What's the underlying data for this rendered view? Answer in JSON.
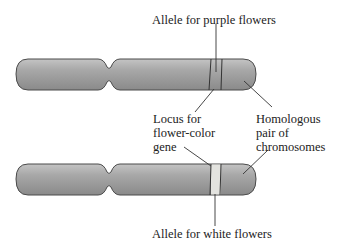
{
  "labels": {
    "allele_purple": "Allele for purple flowers",
    "locus_line1": "Locus for",
    "locus_line2": "flower-color",
    "locus_line3": "gene",
    "homologous_line1": "Homologous",
    "homologous_line2": "pair of",
    "homologous_line3": "chromosomes",
    "allele_white": "Allele for white flowers"
  },
  "colors": {
    "chromosome_fill": "#9e9e9e",
    "chromosome_outline": "#4a4a4a",
    "white_allele_band": "#e3e3df",
    "line": "#333333",
    "text": "#222222"
  }
}
